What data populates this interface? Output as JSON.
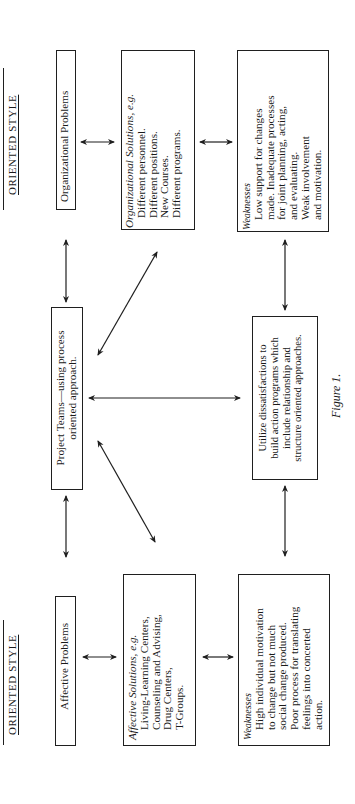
{
  "diagram": {
    "caption": "Figure 1.",
    "left_column": {
      "heading": "ORIENTED STYLE",
      "problems": "Affective Problems",
      "solutions": {
        "title": "Affective Solutions, e.g.",
        "items": [
          "Living-Learning Centers,",
          "Counseling and Advising,",
          "Drug Centers,",
          "T-Groups."
        ]
      },
      "weaknesses": {
        "title": "Weaknesses",
        "lines": [
          "High individual motivation",
          "to change but not much",
          "social change produced.",
          "Poor process for translating",
          "feelings into concerted",
          "action."
        ]
      }
    },
    "center_column": {
      "project_teams": [
        "Project Teams—using process",
        "oriented approach."
      ],
      "utilize": [
        "Utilize dissatisfactions to",
        "build action programs which",
        "include relationship and",
        "structure oriented approaches."
      ]
    },
    "right_column": {
      "heading": "ORIENTED STYLE",
      "problems": "Organizational Problems",
      "solutions": {
        "title": "Organizational Solutions, e.g.",
        "items": [
          "Different personnel.",
          "Different positions.",
          "New Courses.",
          "Different programs."
        ]
      },
      "weaknesses": {
        "title": "Weaknesses",
        "lines": [
          "Low support for changes",
          "made. Inadequate processes",
          "for joint planning, acting,",
          "and evaluating.",
          "Weak involvement",
          "and motivation."
        ]
      }
    },
    "connections": [
      {
        "from": "Organizational Problems",
        "to": "Organizational Solutions",
        "type": "bidirectional"
      },
      {
        "from": "Organizational Solutions",
        "to": "Weaknesses (organizational)",
        "type": "bidirectional"
      },
      {
        "from": "Organizational Problems",
        "to": "Project Teams",
        "type": "bidirectional"
      },
      {
        "from": "Weaknesses (organizational)",
        "to": "Utilize dissatisfactions",
        "type": "bidirectional"
      },
      {
        "from": "Organizational Solutions",
        "to": "Project Teams",
        "type": "bidirectional"
      },
      {
        "from": "Project Teams",
        "to": "Utilize dissatisfactions",
        "type": "bidirectional"
      },
      {
        "from": "Project Teams",
        "to": "Affective Solutions",
        "type": "bidirectional"
      },
      {
        "from": "Project Teams",
        "to": "Affective Problems",
        "type": "bidirectional"
      },
      {
        "from": "Utilize dissatisfactions",
        "to": "Weaknesses (affective)",
        "type": "bidirectional"
      },
      {
        "from": "Affective Problems",
        "to": "Affective Solutions",
        "type": "bidirectional"
      },
      {
        "from": "Affective Solutions",
        "to": "Weaknesses (affective)",
        "type": "bidirectional"
      }
    ]
  }
}
